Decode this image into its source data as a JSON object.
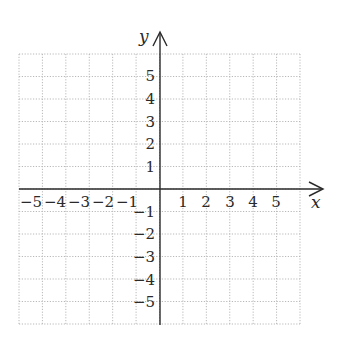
{
  "diagram": {
    "type": "coordinate-grid",
    "x_axis": {
      "label": "x",
      "range": [
        -6,
        6
      ],
      "tick_labels": [
        "−5",
        "−4",
        "−3",
        "−2",
        "−1",
        "1",
        "2",
        "3",
        "4",
        "5"
      ]
    },
    "y_axis": {
      "label": "y",
      "range": [
        -6,
        6
      ],
      "tick_labels": [
        "5",
        "4",
        "3",
        "2",
        "1",
        "−1",
        "−2",
        "−3",
        "−4",
        "−5"
      ]
    },
    "grid": {
      "style": "dotted",
      "color": "#b8b8b8",
      "cells_x": 12,
      "cells_y": 12
    },
    "axis_color": "#2a2a2a"
  }
}
